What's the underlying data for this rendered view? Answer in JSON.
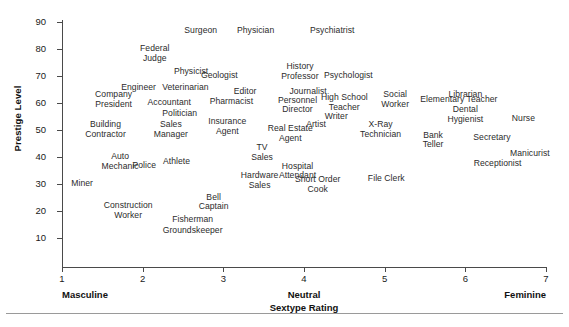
{
  "chart_data": {
    "type": "scatter",
    "title": "",
    "xlabel": "Sextype Rating",
    "ylabel": "Prestige Level",
    "xlim": [
      1,
      7
    ],
    "ylim": [
      5,
      92
    ],
    "grid": false,
    "legend": null,
    "marker_style": "text-label",
    "x_axis": {
      "ticks": [
        1,
        2,
        3,
        4,
        5,
        6,
        7
      ],
      "tick_labels": [
        "1",
        "2",
        "3",
        "4",
        "5",
        "6",
        "7"
      ],
      "anchors": {
        "low": "Masculine",
        "mid": "Neutral",
        "high": "Feminine"
      },
      "title": "Sextype Rating"
    },
    "y_axis": {
      "ticks": [
        10,
        20,
        30,
        40,
        50,
        60,
        70,
        80,
        90
      ],
      "tick_labels": [
        "10",
        "20",
        "30",
        "40",
        "50",
        "60",
        "70",
        "80",
        "90"
      ],
      "title": "Prestige Level"
    },
    "points": [
      {
        "label": "Surgeon",
        "x": 2.72,
        "y": 86.5
      },
      {
        "label": "Physician",
        "x": 3.4,
        "y": 86.5
      },
      {
        "label": "Psychiatrist",
        "x": 4.35,
        "y": 86.5
      },
      {
        "label": "Federal\nJudge",
        "x": 2.15,
        "y": 78.0
      },
      {
        "label": "Physicist",
        "x": 2.6,
        "y": 71.5
      },
      {
        "label": "Geologist",
        "x": 2.95,
        "y": 70.0
      },
      {
        "label": "History\nProfessor",
        "x": 3.95,
        "y": 71.5
      },
      {
        "label": "Psychologist",
        "x": 4.55,
        "y": 70.0
      },
      {
        "label": "Engineer",
        "x": 1.95,
        "y": 65.5
      },
      {
        "label": "Veterinarian",
        "x": 2.53,
        "y": 65.5
      },
      {
        "label": "Editor",
        "x": 3.27,
        "y": 64.0
      },
      {
        "label": "Journalist",
        "x": 4.05,
        "y": 64.0
      },
      {
        "label": "Company\nPresident",
        "x": 1.64,
        "y": 61.0
      },
      {
        "label": "Accountant",
        "x": 2.33,
        "y": 60.0
      },
      {
        "label": "Pharmacist",
        "x": 3.1,
        "y": 60.5
      },
      {
        "label": "Personnel\nDirector",
        "x": 3.92,
        "y": 59.0
      },
      {
        "label": "High School\nTeacher",
        "x": 4.5,
        "y": 60.0
      },
      {
        "label": "Social\nWorker",
        "x": 5.13,
        "y": 61.0
      },
      {
        "label": "Librarian",
        "x": 6.0,
        "y": 63.0
      },
      {
        "label": "Elementary Teacher",
        "x": 5.92,
        "y": 61.0
      },
      {
        "label": "Politician",
        "x": 2.46,
        "y": 56.0
      },
      {
        "label": "Writer",
        "x": 4.4,
        "y": 55.0
      },
      {
        "label": "Dental\nHygienist",
        "x": 6.0,
        "y": 55.5
      },
      {
        "label": "Nurse",
        "x": 6.72,
        "y": 54.0
      },
      {
        "label": "Building\nContractor",
        "x": 1.54,
        "y": 50.0
      },
      {
        "label": "Sales\nManager",
        "x": 2.35,
        "y": 50.0
      },
      {
        "label": "Insurance\nAgent",
        "x": 3.05,
        "y": 51.0
      },
      {
        "label": "Artist",
        "x": 4.15,
        "y": 52.0
      },
      {
        "label": "Real Estate\nAgent",
        "x": 3.83,
        "y": 48.5
      },
      {
        "label": "X-Ray\nTechnician",
        "x": 4.95,
        "y": 50.0
      },
      {
        "label": "Bank\nTeller",
        "x": 5.6,
        "y": 46.0
      },
      {
        "label": "Secretary",
        "x": 6.33,
        "y": 47.0
      },
      {
        "label": "TV\nSales",
        "x": 3.48,
        "y": 41.5
      },
      {
        "label": "Auto\nMechanic",
        "x": 1.72,
        "y": 38.0
      },
      {
        "label": "Police",
        "x": 2.02,
        "y": 36.5
      },
      {
        "label": "Athlete",
        "x": 2.42,
        "y": 38.0
      },
      {
        "label": "Hospital\nAttendant",
        "x": 3.92,
        "y": 34.5
      },
      {
        "label": "Manicurist",
        "x": 6.8,
        "y": 41.0
      },
      {
        "label": "Receptionist",
        "x": 6.4,
        "y": 37.5
      },
      {
        "label": "Hardware\nSales",
        "x": 3.45,
        "y": 31.0
      },
      {
        "label": "Miner",
        "x": 1.25,
        "y": 30.0
      },
      {
        "label": "Short Order\nCook",
        "x": 4.17,
        "y": 29.5
      },
      {
        "label": "File Clerk",
        "x": 5.02,
        "y": 32.0
      },
      {
        "label": "Bell\nCaptain",
        "x": 2.88,
        "y": 23.0
      },
      {
        "label": "Construction\nWorker",
        "x": 1.82,
        "y": 20.0
      },
      {
        "label": "Fisherman",
        "x": 2.62,
        "y": 16.5
      },
      {
        "label": "Groundskeeper",
        "x": 2.62,
        "y": 12.5
      }
    ]
  }
}
